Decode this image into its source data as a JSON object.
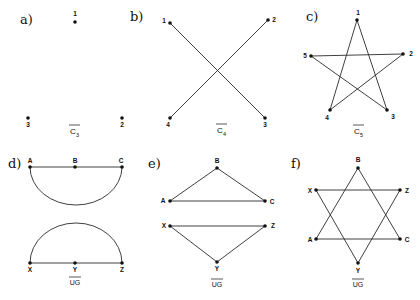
{
  "figure": {
    "panels": [
      {
        "id": "a",
        "label": "a)",
        "caption": "C",
        "caption_sub": "3",
        "vertices": [
          {
            "name": "1",
            "x": 75,
            "y": 22
          },
          {
            "name": "2",
            "x": 122,
            "y": 118
          },
          {
            "name": "3",
            "x": 28,
            "y": 118
          }
        ],
        "edges": []
      },
      {
        "id": "b",
        "label": "b)",
        "caption": "C",
        "caption_sub": "4",
        "vertices": [
          {
            "name": "1",
            "x": 170,
            "y": 23
          },
          {
            "name": "2",
            "x": 268,
            "y": 20
          },
          {
            "name": "3",
            "x": 265,
            "y": 118
          },
          {
            "name": "4",
            "x": 170,
            "y": 118
          }
        ],
        "edges": [
          [
            "1",
            "3"
          ],
          [
            "2",
            "4"
          ]
        ]
      },
      {
        "id": "c",
        "label": "c)",
        "caption": "C",
        "caption_sub": "5",
        "vertices": [
          {
            "name": "1",
            "x": 357,
            "y": 20
          },
          {
            "name": "2",
            "x": 403,
            "y": 54
          },
          {
            "name": "3",
            "x": 387,
            "y": 110
          },
          {
            "name": "4",
            "x": 330,
            "y": 110
          },
          {
            "name": "5",
            "x": 311,
            "y": 56
          }
        ],
        "edges": [
          [
            "1",
            "3"
          ],
          [
            "1",
            "4"
          ],
          [
            "5",
            "2"
          ],
          [
            "5",
            "3"
          ],
          [
            "2",
            "4"
          ]
        ]
      },
      {
        "id": "d",
        "label": "d)",
        "caption": "UG",
        "vertices": [
          {
            "name": "A",
            "x": 30,
            "y": 167
          },
          {
            "name": "B",
            "x": 75,
            "y": 167
          },
          {
            "name": "C",
            "x": 122,
            "y": 167
          },
          {
            "name": "X",
            "x": 30,
            "y": 263
          },
          {
            "name": "Y",
            "x": 75,
            "y": 263
          },
          {
            "name": "Z",
            "x": 122,
            "y": 263
          }
        ],
        "edges": [
          [
            "A",
            "C"
          ],
          [
            "X",
            "Z"
          ]
        ],
        "arcs": [
          {
            "from": "A",
            "to": "C",
            "direction": "down"
          },
          {
            "from": "X",
            "to": "Z",
            "direction": "up"
          }
        ]
      },
      {
        "id": "e",
        "label": "e)",
        "caption": "UG",
        "vertices": [
          {
            "name": "A",
            "x": 170,
            "y": 201
          },
          {
            "name": "B",
            "x": 217,
            "y": 168
          },
          {
            "name": "C",
            "x": 265,
            "y": 201
          },
          {
            "name": "X",
            "x": 170,
            "y": 226
          },
          {
            "name": "Y",
            "x": 217,
            "y": 262
          },
          {
            "name": "Z",
            "x": 265,
            "y": 226
          }
        ],
        "edges": [
          [
            "A",
            "B"
          ],
          [
            "B",
            "C"
          ],
          [
            "A",
            "C"
          ],
          [
            "X",
            "Z"
          ],
          [
            "X",
            "Y"
          ],
          [
            "Y",
            "Z"
          ]
        ]
      },
      {
        "id": "f",
        "label": "f)",
        "caption": "UG",
        "vertices": [
          {
            "name": "A",
            "x": 316,
            "y": 239
          },
          {
            "name": "B",
            "x": 358,
            "y": 168
          },
          {
            "name": "C",
            "x": 400,
            "y": 239
          },
          {
            "name": "X",
            "x": 316,
            "y": 190
          },
          {
            "name": "Y",
            "x": 358,
            "y": 263
          },
          {
            "name": "Z",
            "x": 400,
            "y": 190
          }
        ],
        "edges": [
          [
            "A",
            "B"
          ],
          [
            "B",
            "C"
          ],
          [
            "A",
            "C"
          ],
          [
            "X",
            "Z"
          ],
          [
            "X",
            "Y"
          ],
          [
            "Y",
            "Z"
          ]
        ]
      }
    ]
  }
}
